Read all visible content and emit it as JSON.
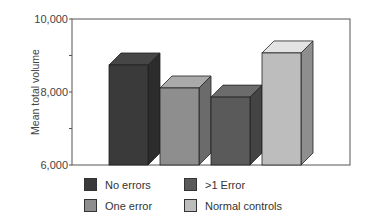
{
  "chart_data": {
    "type": "bar",
    "style": "3d",
    "title": "",
    "xlabel": "",
    "ylabel": "Mean total volume",
    "ylim": [
      6000,
      10000
    ],
    "yticks": [
      6000,
      8000,
      10000
    ],
    "ytick_labels": [
      "6,000",
      "8,000",
      "10,000"
    ],
    "grid": false,
    "legend_position": "bottom",
    "categories": [
      "No errors",
      "One error",
      ">1 Error",
      "Normal controls"
    ],
    "values": [
      8740,
      8110,
      7860,
      9070
    ],
    "colors": [
      "#3a3a3a",
      "#8e8e8e",
      "#5a5a5a",
      "#bdbdbd"
    ]
  },
  "legend": {
    "items": [
      {
        "label": "No errors",
        "color": "#3a3a3a"
      },
      {
        "label": ">1 Error",
        "color": "#5a5a5a"
      },
      {
        "label": "One error",
        "color": "#8e8e8e"
      },
      {
        "label": "Normal controls",
        "color": "#bdbdbd"
      }
    ]
  }
}
